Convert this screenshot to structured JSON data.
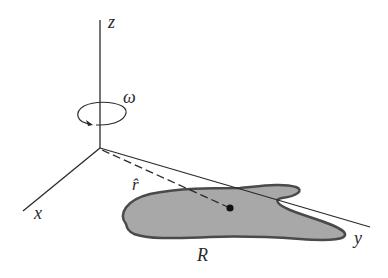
{
  "diagram": {
    "type": "3d-axes-rotation",
    "labels": {
      "z_axis": "z",
      "x_axis": "x",
      "y_axis": "y",
      "angular_velocity": "ω",
      "unit_vector": "r̂",
      "region": "R"
    },
    "colors": {
      "axis": "#2a2a2a",
      "region_fill": "#a8a8a8",
      "region_stroke": "#4a4a4a",
      "dot": "#111111"
    }
  }
}
